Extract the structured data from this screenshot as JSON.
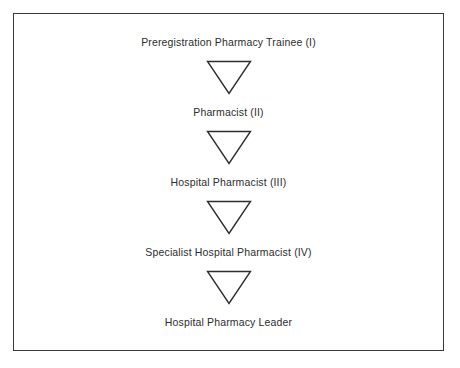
{
  "figure": {
    "border_color": "#3a3a3a",
    "background_color": "#ffffff",
    "text_color": "#2d2d2d"
  },
  "flowchart": {
    "type": "linear-progression",
    "orientation": "vertical",
    "connector_icon": "downward-triangle-arrow-icon",
    "stages": [
      {
        "label": "Preregistration Pharmacy Trainee (I)",
        "level": "I"
      },
      {
        "label": "Pharmacist (II)",
        "level": "II"
      },
      {
        "label": "Hospital Pharmacist (III)",
        "level": "III"
      },
      {
        "label": "Specialist Hospital Pharmacist (IV)",
        "level": "IV"
      },
      {
        "label": "Hospital Pharmacy Leader",
        "level": ""
      }
    ],
    "connectors": [
      {
        "from": "Preregistration Pharmacy Trainee (I)",
        "to": "Pharmacist (II)"
      },
      {
        "from": "Pharmacist (II)",
        "to": "Hospital Pharmacist (III)"
      },
      {
        "from": "Hospital Pharmacist (III)",
        "to": "Specialist Hospital Pharmacist (IV)"
      },
      {
        "from": "Specialist Hospital Pharmacist (IV)",
        "to": "Hospital Pharmacy Leader"
      }
    ]
  }
}
